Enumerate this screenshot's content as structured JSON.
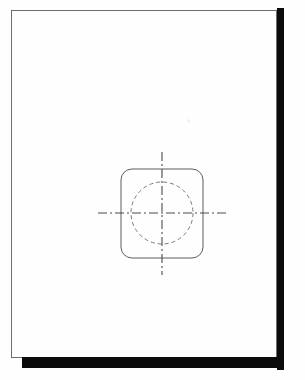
{
  "document": {
    "kind": "scanned-engineering-drawing",
    "page_width": 305,
    "page_height": 380,
    "background_color": "#fefefe",
    "frame": {
      "label": "drawing-border-frame",
      "x": 11,
      "y": 10,
      "width": 266,
      "height": 348,
      "stroke_color": "#6e6e6e",
      "stroke_width": 1
    },
    "scan_artifacts": {
      "right_bar": {
        "label": "scanner-edge-bar-right",
        "x": 277,
        "y": 8,
        "width": 7,
        "height": 362,
        "color": "#0b0b0b"
      },
      "bottom_bar": {
        "label": "scanner-edge-bar-bottom",
        "x": 22,
        "y": 357,
        "width": 262,
        "height": 11,
        "color": "#0b0b0b"
      },
      "speck": {
        "label": "faint-scan-speck",
        "x": 187,
        "y": 119,
        "width": 3,
        "height": 4,
        "color": "#f2f2f2"
      }
    }
  },
  "geometry": {
    "center": {
      "x": 162,
      "y": 213
    },
    "rounded_square": {
      "label": "rounded-square-outline",
      "left": 121,
      "top": 169,
      "right": 203,
      "bottom": 258,
      "width": 82,
      "height": 89,
      "corner_radius": 11,
      "stroke_color": "#5d5d5d",
      "stroke_width": 1,
      "line_type": "visible-object-line",
      "path": "M 132 169 L 192 169 A 11 11 0 0 1 203 180 L 203 247 A 11 11 0 0 1 192 258 L 132 258 A 11 11 0 0 1 121 247 L 121 180 A 11 11 0 0 1 132 169 Z"
    },
    "hidden_circle": {
      "label": "hidden-hole-circle",
      "cx": 162,
      "cy": 213,
      "r": 31,
      "diameter": 62,
      "stroke_color": "#7a7a7a",
      "stroke_width": 1,
      "line_type": "hidden-dashed-line",
      "dash_pattern": "4 3"
    },
    "vertical_center_line": {
      "label": "vertical-centerline",
      "x": 162,
      "y1": 152,
      "y2": 275,
      "stroke_color": "#4a4a4a",
      "stroke_width": 1.1,
      "line_type": "center-line",
      "dash_pattern": "9 3 2 3"
    },
    "horizontal_center_line": {
      "label": "horizontal-centerline",
      "y": 213,
      "x1": 98,
      "x2": 226,
      "stroke_color": "#4a4a4a",
      "stroke_width": 1.1,
      "line_type": "center-line",
      "dash_pattern": "9 3 2 3"
    }
  }
}
